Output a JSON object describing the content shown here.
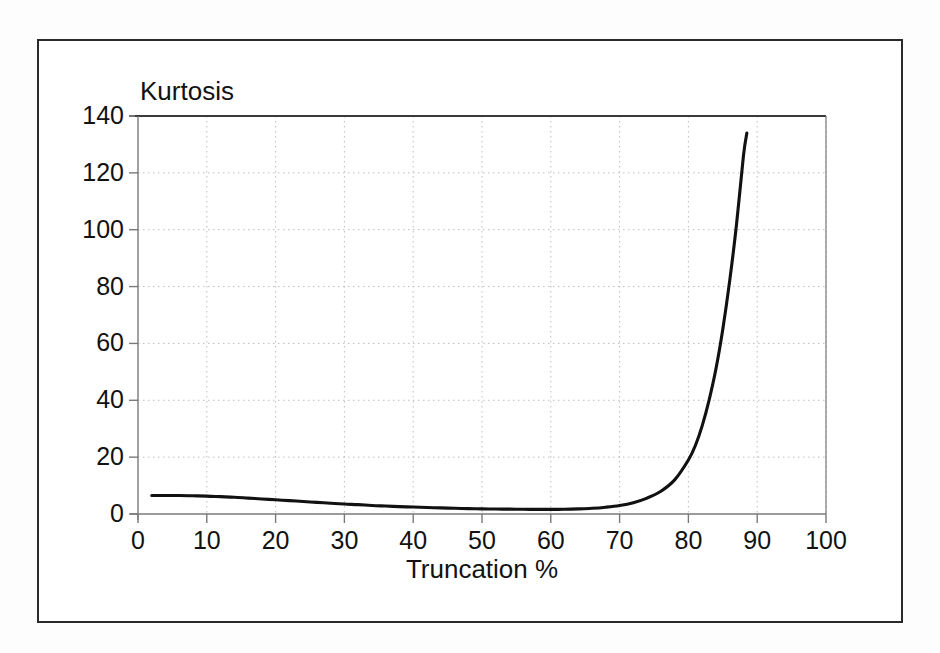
{
  "figure": {
    "background_color": "#ffffff",
    "frame_color": "#2a2a2a",
    "axis_color": "#7a7a7a",
    "grid_color": "#bdbdbd",
    "curve_color": "#111111",
    "text_color": "#121212",
    "y_axis_title": "Kurtosis",
    "x_axis_title": "Truncation %"
  },
  "chart_data": {
    "type": "line",
    "title": "",
    "subtitle": "",
    "xlabel": "Truncation %",
    "ylabel": "Kurtosis",
    "xlim": [
      0,
      100
    ],
    "ylim": [
      0,
      140
    ],
    "grid": true,
    "grid_style": "dotted",
    "legend": "none",
    "x_ticks": [
      0,
      10,
      20,
      30,
      40,
      50,
      60,
      70,
      80,
      90,
      100
    ],
    "x_tick_labels": [
      "0",
      "10",
      "20",
      "30",
      "40",
      "50",
      "60",
      "70",
      "80",
      "90",
      "100"
    ],
    "y_ticks": [
      0,
      20,
      40,
      60,
      80,
      100,
      120,
      140
    ],
    "y_tick_labels": [
      "0",
      "20",
      "40",
      "60",
      "80",
      "100",
      "120",
      "140"
    ],
    "x_minor_grid_interval": 10,
    "y_minor_grid_interval": 20,
    "series": [
      {
        "name": "Kurtosis",
        "x": [
          2,
          4,
          6,
          8,
          10,
          12,
          14,
          16,
          18,
          20,
          22,
          24,
          26,
          28,
          30,
          32,
          34,
          36,
          38,
          40,
          42,
          44,
          46,
          48,
          50,
          52,
          54,
          56,
          58,
          60,
          62,
          64,
          66,
          68,
          70,
          72,
          74,
          76,
          78,
          80,
          81,
          82,
          83,
          84,
          85,
          86,
          87,
          88,
          88.5
        ],
        "y": [
          6.5,
          6.5,
          6.5,
          6.4,
          6.3,
          6.1,
          5.9,
          5.6,
          5.3,
          5.0,
          4.7,
          4.4,
          4.1,
          3.8,
          3.5,
          3.3,
          3.0,
          2.8,
          2.6,
          2.45,
          2.3,
          2.15,
          2.0,
          1.9,
          1.8,
          1.75,
          1.7,
          1.65,
          1.62,
          1.62,
          1.68,
          1.8,
          2.0,
          2.4,
          3.0,
          4.0,
          5.6,
          8.0,
          12.0,
          19.0,
          24.0,
          31.0,
          40.0,
          51.0,
          65.0,
          82.0,
          102.0,
          126.0,
          134.0
        ]
      }
    ],
    "annotations": [
      {
        "text": "minimum near 58% truncation",
        "value": 1.62
      },
      {
        "text": "endpoint",
        "x": 88.5,
        "y": 134
      }
    ]
  },
  "geometry": {
    "plot_left": 138,
    "plot_right": 826,
    "plot_top": 116,
    "plot_bottom": 514
  }
}
